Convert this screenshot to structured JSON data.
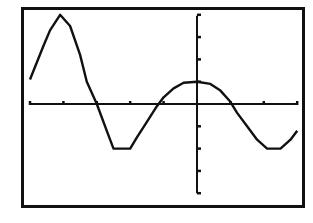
{
  "window": {
    "frame": {
      "x": 22,
      "y": 8,
      "width": 282,
      "height": 199
    },
    "colors": {
      "background": "#ffffff",
      "ink": "#111111"
    }
  },
  "chart_data": {
    "type": "line",
    "title": "",
    "xlabel": "",
    "ylabel": "",
    "grid": false,
    "legend": null,
    "axes_origin_px": {
      "x": 197,
      "y": 104
    },
    "tick_spacing_px": {
      "x": 33.4,
      "y": 22.3
    },
    "x_ticks": [
      -5,
      -4,
      -3,
      -2,
      -1,
      0,
      1,
      2,
      3
    ],
    "y_ticks": [
      -4,
      -3,
      -2,
      -1,
      0,
      1,
      2,
      3,
      4
    ],
    "xlim": [
      -5.1,
      3.2
    ],
    "ylim": [
      -4.5,
      4.3
    ],
    "series": [
      {
        "name": "y1",
        "x": [
          -5.0,
          -4.6,
          -4.4,
          -4.1,
          -3.8,
          -3.5,
          -3.3,
          -3.0,
          -2.7,
          -2.5,
          -2.2,
          -2.0,
          -1.8,
          -1.5,
          -1.2,
          -1.0,
          -0.7,
          -0.4,
          0.0,
          0.4,
          0.7,
          1.0,
          1.2,
          1.5,
          1.8,
          2.1,
          2.5,
          2.8,
          3.0
        ],
        "values": [
          1.1,
          2.6,
          3.3,
          4.0,
          3.5,
          2.2,
          1.0,
          0.0,
          -1.2,
          -2.0,
          -2.0,
          -2.0,
          -1.5,
          -0.8,
          -0.1,
          0.3,
          0.7,
          0.95,
          1.0,
          0.9,
          0.6,
          0.1,
          -0.4,
          -1.0,
          -1.6,
          -2.0,
          -2.0,
          -1.6,
          -1.2
        ]
      }
    ]
  }
}
